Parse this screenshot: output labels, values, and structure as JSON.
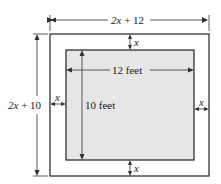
{
  "diagram": {
    "type": "dimensioned-rectangle-with-border",
    "outer_rect": {
      "width_label_var": "2x",
      "width_label_rest": " + 12",
      "height_label_var": "2x",
      "height_label_rest": " + 10"
    },
    "inner_rect": {
      "width_label": "12 feet",
      "height_label": "10 feet",
      "fill": "#e6e6e6"
    },
    "border_labels": {
      "top": "x",
      "bottom": "x",
      "left": "x",
      "right": "x"
    },
    "colors": {
      "line": "#333333",
      "inner_fill": "#e6e6e6",
      "background": "#ffffff"
    }
  }
}
